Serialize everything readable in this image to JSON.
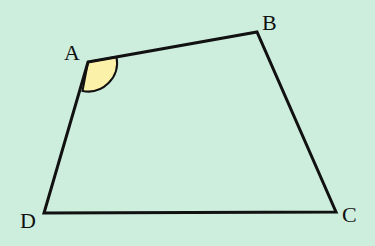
{
  "diagram": {
    "type": "quadrilateral",
    "background": "#cdeedd",
    "stroke": "#111111",
    "angle_fill": "#fbf1a8",
    "vertices": {
      "A": {
        "label": "A",
        "x": 88,
        "y": 62,
        "lx": 64,
        "ly": 60
      },
      "B": {
        "label": "B",
        "x": 257,
        "y": 32,
        "lx": 262,
        "ly": 30
      },
      "C": {
        "label": "C",
        "x": 336,
        "y": 212,
        "lx": 342,
        "ly": 222
      },
      "D": {
        "label": "D",
        "x": 44,
        "y": 213,
        "lx": 20,
        "ly": 228
      }
    },
    "marked_angle": "A"
  }
}
